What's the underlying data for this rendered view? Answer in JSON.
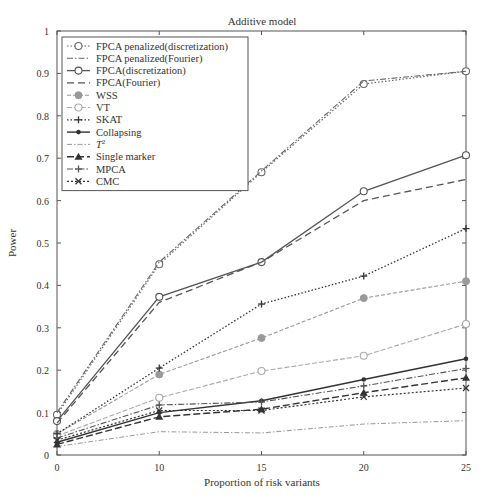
{
  "chart_data": {
    "type": "line",
    "title": "Additive model",
    "xlabel": "Proportion of risk variants",
    "ylabel": "Power",
    "categories": [
      "0",
      "10",
      "15",
      "20",
      "25"
    ],
    "ylim": [
      0,
      1
    ],
    "yticks": [
      0,
      0.1,
      0.2,
      0.3,
      0.4,
      0.5,
      0.6,
      0.7,
      0.8,
      0.9,
      1
    ],
    "ytick_labels": [
      "0",
      "0.1",
      "0.2",
      "0.3",
      "0.4",
      "0.5",
      "0.6",
      "0.7",
      "0.8",
      "0.9",
      "1"
    ],
    "grid": false,
    "legend_position": "upper left",
    "series": [
      {
        "name": "FPCA penalized(discretization)",
        "values": [
          0.095,
          0.45,
          0.667,
          0.875,
          0.905
        ],
        "color": "#666666",
        "dash": "1.5,2",
        "width": 1.2,
        "marker": "circle-open",
        "marker_color": "#666666"
      },
      {
        "name": "FPCA penalized(Fourier)",
        "values": [
          0.1,
          0.455,
          0.67,
          0.882,
          0.905
        ],
        "color": "#666666",
        "dash": "6,2,1.5,2",
        "width": 1.1,
        "marker": "none",
        "marker_color": "#666666"
      },
      {
        "name": "FPCA(discretization)",
        "values": [
          0.08,
          0.373,
          0.455,
          0.622,
          0.707
        ],
        "color": "#555555",
        "dash": "",
        "width": 1.3,
        "marker": "circle-open",
        "marker_color": "#555555"
      },
      {
        "name": "FPCA(Fourier)",
        "values": [
          0.075,
          0.36,
          0.455,
          0.6,
          0.65
        ],
        "color": "#555555",
        "dash": "7,4",
        "width": 1.3,
        "marker": "none",
        "marker_color": "#555555"
      },
      {
        "name": "WSS",
        "values": [
          0.05,
          0.19,
          0.276,
          0.37,
          0.41
        ],
        "color": "#999999",
        "dash": "4,2",
        "width": 1.1,
        "marker": "circle-filled",
        "marker_color": "#999999"
      },
      {
        "name": "VT",
        "values": [
          0.045,
          0.135,
          0.198,
          0.234,
          0.309
        ],
        "color": "#aaaaaa",
        "dash": "5,2",
        "width": 1.1,
        "marker": "circle-open",
        "marker_color": "#aaaaaa"
      },
      {
        "name": "SKAT",
        "values": [
          0.05,
          0.205,
          0.356,
          0.422,
          0.534
        ],
        "color": "#333333",
        "dash": "1.5,2",
        "width": 1.3,
        "marker": "plus",
        "marker_color": "#333333"
      },
      {
        "name": "Collapsing",
        "values": [
          0.03,
          0.1,
          0.128,
          0.178,
          0.227
        ],
        "color": "#333333",
        "dash": "",
        "width": 1.4,
        "marker": "dot",
        "marker_color": "#333333"
      },
      {
        "name": "T²",
        "values": [
          0.02,
          0.055,
          0.052,
          0.073,
          0.081
        ],
        "color": "#999999",
        "dash": "5,2,1.5,2",
        "width": 1.0,
        "marker": "none",
        "marker_color": "#999999"
      },
      {
        "name": "Single marker",
        "values": [
          0.025,
          0.09,
          0.108,
          0.147,
          0.182
        ],
        "color": "#333333",
        "dash": "7,3",
        "width": 1.4,
        "marker": "triangle",
        "marker_color": "#333333"
      },
      {
        "name": "MPCA",
        "values": [
          0.04,
          0.118,
          0.125,
          0.163,
          0.204
        ],
        "color": "#555555",
        "dash": "6,2,1.5,2",
        "width": 1.1,
        "marker": "plus",
        "marker_color": "#555555"
      },
      {
        "name": "CMC",
        "values": [
          0.035,
          0.105,
          0.105,
          0.137,
          0.158
        ],
        "color": "#333333",
        "dash": "2,2",
        "width": 1.2,
        "marker": "x",
        "marker_color": "#333333"
      }
    ]
  },
  "legend": {
    "items": [
      {
        "label": "FPCA penalized(discretization)"
      },
      {
        "label": "FPCA penalized(Fourier)"
      },
      {
        "label": "FPCA(discretization)"
      },
      {
        "label": "FPCA(Fourier)"
      },
      {
        "label": "WSS"
      },
      {
        "label": "VT"
      },
      {
        "label": "SKAT"
      },
      {
        "label": "Collapsing"
      },
      {
        "label": "T²"
      },
      {
        "label": "Single marker"
      },
      {
        "label": "MPCA"
      },
      {
        "label": "CMC"
      }
    ]
  }
}
